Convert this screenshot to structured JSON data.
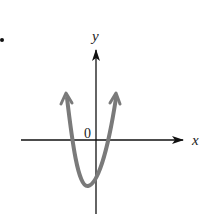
{
  "figure": {
    "bullet": "•",
    "x_axis_label": "x",
    "y_axis_label": "y",
    "origin_label": "0",
    "curve": "upward-opening parabola with vertex below x-axis, slightly left of y-axis; two x-intercepts (one negative, one positive); arrows on both ends",
    "colors": {
      "axes": "#111111",
      "curve": "#7a7a7a"
    }
  }
}
